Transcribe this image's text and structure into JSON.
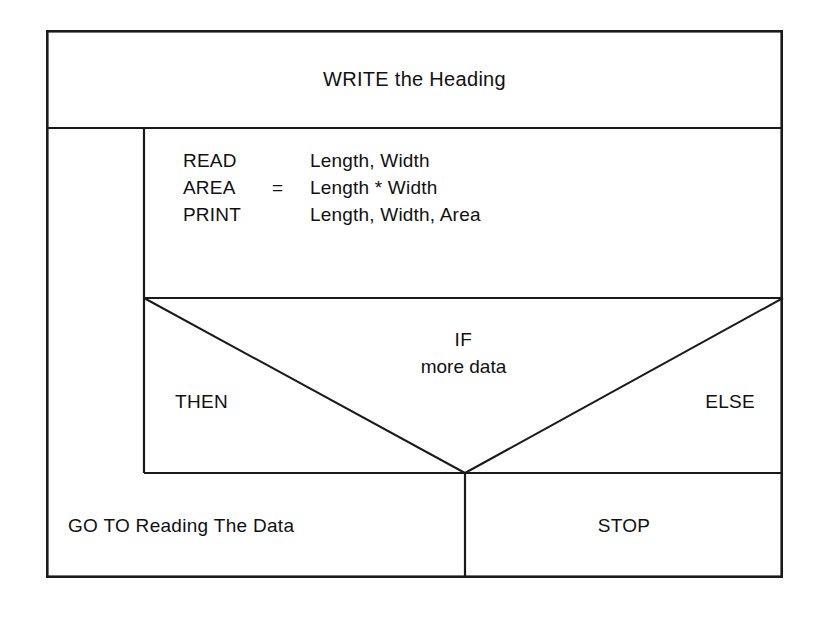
{
  "diagram": {
    "type": "nassi-shneiderman-structogram",
    "title_block": {
      "label": "WRITE the Heading"
    },
    "process_block": {
      "statements": [
        {
          "keyword": "READ",
          "operator": "",
          "operand": "Length, Width"
        },
        {
          "keyword": "AREA",
          "operator": "=",
          "operand": "Length * Width"
        },
        {
          "keyword": "PRINT",
          "operator": "",
          "operand": "Length, Width, Area"
        }
      ]
    },
    "decision_block": {
      "condition_keyword": "IF",
      "condition_text": "more data",
      "then_label": "THEN",
      "else_label": "ELSE",
      "then_branch": "GO TO Reading The Data",
      "else_branch": "STOP"
    },
    "colors": {
      "line": "#1a1a1a",
      "background": "#ffffff",
      "text": "#111111"
    }
  }
}
